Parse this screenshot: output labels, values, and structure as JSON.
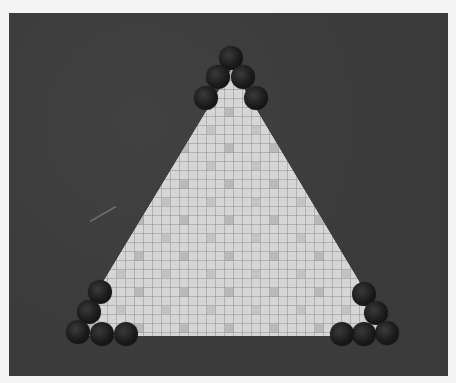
{
  "game": {
    "board_shape": "triangle",
    "board_pattern": "tiled-grid",
    "colors": {
      "background": "#3b3b3b",
      "tile_light": "#d8d8d8",
      "tile_line": "#8a8a8a",
      "tile_dark": "#9a9a9a",
      "ball": "#161616",
      "frame": "#f4f4f4"
    },
    "piece_groups": [
      {
        "name": "top-corner",
        "count": 5
      },
      {
        "name": "bottom-left-corner",
        "count": 5
      },
      {
        "name": "bottom-right-corner",
        "count": 5
      }
    ]
  }
}
